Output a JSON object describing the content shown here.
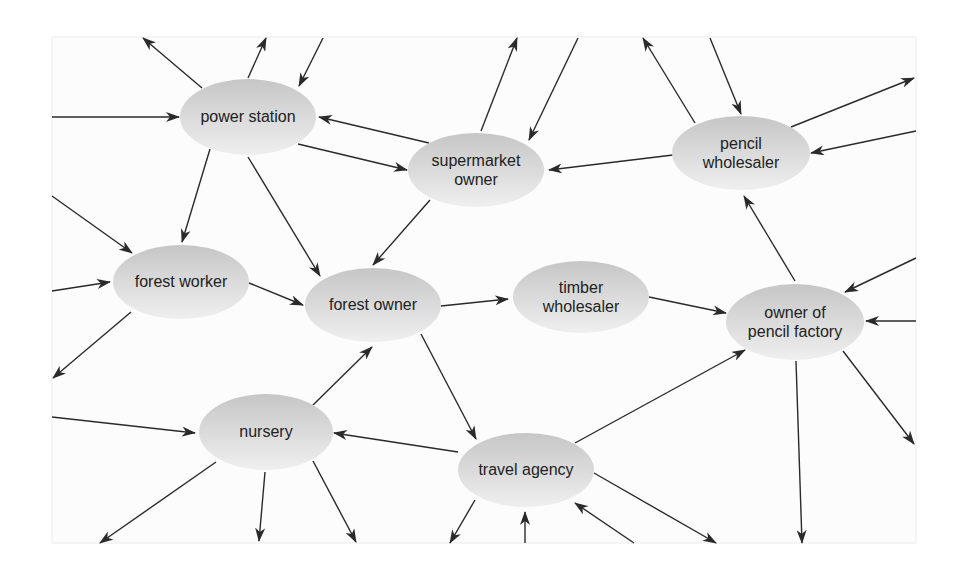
{
  "diagram": {
    "title": "",
    "colors": {
      "node_top": "#c6c6c6",
      "node_bottom": "#efefef",
      "edge": "#2a2a2a",
      "text": "#222222",
      "panel": "#fcfcfc"
    },
    "panel": {
      "x": 52,
      "y": 37,
      "width": 864,
      "height": 506
    },
    "nodes": [
      {
        "id": "power-station",
        "lines": [
          "power station"
        ],
        "cx": 248,
        "cy": 117,
        "rx": 68,
        "ry": 38
      },
      {
        "id": "supermarket-owner",
        "lines": [
          "supermarket",
          "owner"
        ],
        "cx": 476,
        "cy": 170,
        "rx": 68,
        "ry": 37
      },
      {
        "id": "pencil-wholesaler",
        "lines": [
          "pencil",
          "wholesaler"
        ],
        "cx": 741,
        "cy": 153,
        "rx": 69,
        "ry": 37
      },
      {
        "id": "forest-worker",
        "lines": [
          "forest worker"
        ],
        "cx": 181,
        "cy": 282,
        "rx": 68,
        "ry": 37
      },
      {
        "id": "forest-owner",
        "lines": [
          "forest owner"
        ],
        "cx": 373,
        "cy": 305,
        "rx": 68,
        "ry": 37
      },
      {
        "id": "timber-wholesaler",
        "lines": [
          "timber",
          "wholesaler"
        ],
        "cx": 581,
        "cy": 297,
        "rx": 68,
        "ry": 36
      },
      {
        "id": "owner-of-pencil-factory",
        "lines": [
          "owner of",
          "pencil factory"
        ],
        "cx": 795,
        "cy": 322,
        "rx": 69,
        "ry": 38
      },
      {
        "id": "nursery",
        "lines": [
          "nursery"
        ],
        "cx": 266,
        "cy": 432,
        "rx": 67,
        "ry": 38
      },
      {
        "id": "travel-agency",
        "lines": [
          "travel agency"
        ],
        "cx": 526,
        "cy": 470,
        "rx": 68,
        "ry": 37
      }
    ],
    "edges": [
      {
        "from": "power-station",
        "to": "external",
        "x1": 202,
        "y1": 88,
        "x2": 143,
        "y2": 38
      },
      {
        "from": "power-station",
        "to": "external",
        "x1": 248,
        "y1": 78,
        "x2": 266,
        "y2": 38
      },
      {
        "from": "external",
        "to": "power-station",
        "x1": 323,
        "y1": 38,
        "x2": 299,
        "y2": 86
      },
      {
        "from": "external",
        "to": "power-station",
        "x1": 52,
        "y1": 117,
        "x2": 179,
        "y2": 117
      },
      {
        "from": "supermarket-owner",
        "to": "power-station",
        "x1": 429,
        "y1": 143,
        "x2": 319,
        "y2": 117
      },
      {
        "from": "power-station",
        "to": "supermarket-owner",
        "x1": 298,
        "y1": 144,
        "x2": 407,
        "y2": 170
      },
      {
        "from": "supermarket-owner",
        "to": "external",
        "x1": 481,
        "y1": 131,
        "x2": 517,
        "y2": 38
      },
      {
        "from": "external",
        "to": "supermarket-owner",
        "x1": 578,
        "y1": 38,
        "x2": 529,
        "y2": 140
      },
      {
        "from": "pencil-wholesaler",
        "to": "external",
        "x1": 695,
        "y1": 123,
        "x2": 643,
        "y2": 38
      },
      {
        "from": "external",
        "to": "pencil-wholesaler",
        "x1": 710,
        "y1": 38,
        "x2": 741,
        "y2": 114
      },
      {
        "from": "pencil-wholesaler",
        "to": "external",
        "x1": 791,
        "y1": 127,
        "x2": 914,
        "y2": 78
      },
      {
        "from": "external",
        "to": "pencil-wholesaler",
        "x1": 916,
        "y1": 131,
        "x2": 811,
        "y2": 153
      },
      {
        "from": "pencil-wholesaler",
        "to": "supermarket-owner",
        "x1": 673,
        "y1": 155,
        "x2": 549,
        "y2": 170
      },
      {
        "from": "power-station",
        "to": "forest-worker",
        "x1": 210,
        "y1": 149,
        "x2": 182,
        "y2": 242
      },
      {
        "from": "power-station",
        "to": "forest-owner",
        "x1": 248,
        "y1": 157,
        "x2": 320,
        "y2": 276
      },
      {
        "from": "supermarket-owner",
        "to": "forest-owner",
        "x1": 430,
        "y1": 200,
        "x2": 373,
        "y2": 265
      },
      {
        "from": "external",
        "to": "forest-worker",
        "x1": 52,
        "y1": 196,
        "x2": 132,
        "y2": 253
      },
      {
        "from": "external",
        "to": "forest-worker",
        "x1": 52,
        "y1": 291,
        "x2": 110,
        "y2": 282
      },
      {
        "from": "forest-worker",
        "to": "external",
        "x1": 131,
        "y1": 312,
        "x2": 53,
        "y2": 378
      },
      {
        "from": "forest-worker",
        "to": "forest-owner",
        "x1": 249,
        "y1": 283,
        "x2": 303,
        "y2": 305
      },
      {
        "from": "forest-owner",
        "to": "timber-wholesaler",
        "x1": 441,
        "y1": 306,
        "x2": 508,
        "y2": 299
      },
      {
        "from": "timber-wholesaler",
        "to": "owner-of-pencil-factory",
        "x1": 649,
        "y1": 297,
        "x2": 726,
        "y2": 313
      },
      {
        "from": "owner-of-pencil-factory",
        "to": "pencil-wholesaler",
        "x1": 795,
        "y1": 281,
        "x2": 744,
        "y2": 196
      },
      {
        "from": "external",
        "to": "owner-of-pencil-factory",
        "x1": 916,
        "y1": 258,
        "x2": 845,
        "y2": 292
      },
      {
        "from": "external",
        "to": "owner-of-pencil-factory",
        "x1": 916,
        "y1": 321,
        "x2": 866,
        "y2": 321
      },
      {
        "from": "owner-of-pencil-factory",
        "to": "external",
        "x1": 843,
        "y1": 351,
        "x2": 914,
        "y2": 444
      },
      {
        "from": "owner-of-pencil-factory",
        "to": "external",
        "x1": 796,
        "y1": 361,
        "x2": 802,
        "y2": 543
      },
      {
        "from": "travel-agency",
        "to": "owner-of-pencil-factory",
        "x1": 575,
        "y1": 443,
        "x2": 745,
        "y2": 350
      },
      {
        "from": "forest-owner",
        "to": "travel-agency",
        "x1": 421,
        "y1": 334,
        "x2": 476,
        "y2": 439
      },
      {
        "from": "nursery",
        "to": "forest-owner",
        "x1": 313,
        "y1": 405,
        "x2": 372,
        "y2": 347
      },
      {
        "from": "travel-agency",
        "to": "nursery",
        "x1": 458,
        "y1": 452,
        "x2": 334,
        "y2": 433
      },
      {
        "from": "external",
        "to": "nursery",
        "x1": 52,
        "y1": 417,
        "x2": 195,
        "y2": 433
      },
      {
        "from": "nursery",
        "to": "external",
        "x1": 216,
        "y1": 462,
        "x2": 100,
        "y2": 543
      },
      {
        "from": "nursery",
        "to": "external",
        "x1": 265,
        "y1": 472,
        "x2": 259,
        "y2": 541
      },
      {
        "from": "nursery",
        "to": "external",
        "x1": 313,
        "y1": 461,
        "x2": 356,
        "y2": 542
      },
      {
        "from": "travel-agency",
        "to": "external",
        "x1": 475,
        "y1": 500,
        "x2": 450,
        "y2": 543
      },
      {
        "from": "external",
        "to": "travel-agency",
        "x1": 525,
        "y1": 543,
        "x2": 525,
        "y2": 512
      },
      {
        "from": "external",
        "to": "travel-agency",
        "x1": 634,
        "y1": 543,
        "x2": 575,
        "y2": 503
      },
      {
        "from": "travel-agency",
        "to": "external",
        "x1": 594,
        "y1": 473,
        "x2": 716,
        "y2": 543
      }
    ]
  }
}
